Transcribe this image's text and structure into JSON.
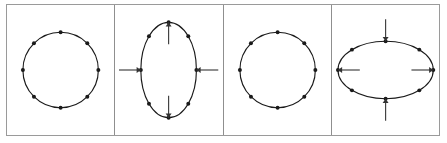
{
  "figure": {
    "name": "ring-deformation-sequence",
    "panel_count": 4,
    "background_color": "#ffffff",
    "frame_color": "#9a9a9a",
    "divider_color": "#8f8f8f",
    "curve_color": "#1a1a1a",
    "dot_color": "#1a1a1a",
    "arrow_color": "#333333",
    "particle_count_per_panel": 8,
    "particle_angles_deg": [
      90,
      45,
      0,
      315,
      270,
      225,
      180,
      135
    ]
  },
  "panels": [
    {
      "id": "panel-1",
      "label": "undeformed-ring",
      "shape": "circle",
      "rx": 38,
      "ry": 38,
      "cx": 54,
      "cy": 65,
      "arrows": []
    },
    {
      "id": "panel-2",
      "label": "ring-stretched-vertically",
      "shape": "ellipse",
      "rx": 28,
      "ry": 48,
      "cx": 54,
      "cy": 65,
      "arrows": [
        {
          "name": "arrow-up",
          "direction": "up",
          "axis": "vertical",
          "sense": "outward",
          "x": 54,
          "y": 17,
          "length": 22
        },
        {
          "name": "arrow-down",
          "direction": "down",
          "axis": "vertical",
          "sense": "outward",
          "x": 54,
          "y": 113,
          "length": 22
        },
        {
          "name": "arrow-left-inward",
          "direction": "right",
          "axis": "horizontal",
          "sense": "inward",
          "x": 26,
          "y": 65,
          "length": 22
        },
        {
          "name": "arrow-right-inward",
          "direction": "left",
          "axis": "horizontal",
          "sense": "inward",
          "x": 82,
          "y": 65,
          "length": 22
        }
      ]
    },
    {
      "id": "panel-3",
      "label": "undeformed-ring",
      "shape": "circle",
      "rx": 38,
      "ry": 38,
      "cx": 54,
      "cy": 65,
      "arrows": []
    },
    {
      "id": "panel-4",
      "label": "ring-stretched-horizontally",
      "shape": "ellipse",
      "rx": 48,
      "ry": 29,
      "cx": 54,
      "cy": 65,
      "arrows": [
        {
          "name": "arrow-top-inward",
          "direction": "down",
          "axis": "vertical",
          "sense": "inward",
          "x": 54,
          "y": 36,
          "length": 22
        },
        {
          "name": "arrow-bottom-inward",
          "direction": "up",
          "axis": "vertical",
          "sense": "inward",
          "x": 54,
          "y": 94,
          "length": 22
        },
        {
          "name": "arrow-left",
          "direction": "left",
          "axis": "horizontal",
          "sense": "outward",
          "x": 6,
          "y": 65,
          "length": 22
        },
        {
          "name": "arrow-right",
          "direction": "right",
          "axis": "horizontal",
          "sense": "outward",
          "x": 102,
          "y": 65,
          "length": 22
        }
      ]
    }
  ]
}
